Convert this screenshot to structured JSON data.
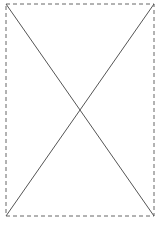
{
  "placeholder": {
    "kind": "image-placeholder",
    "box": {
      "x": 6,
      "y": 4,
      "width": 148,
      "height": 212
    },
    "colors": {
      "background": "#ffffff",
      "border": "#666666",
      "cross": "#555555"
    },
    "border_dash": "4 3"
  }
}
